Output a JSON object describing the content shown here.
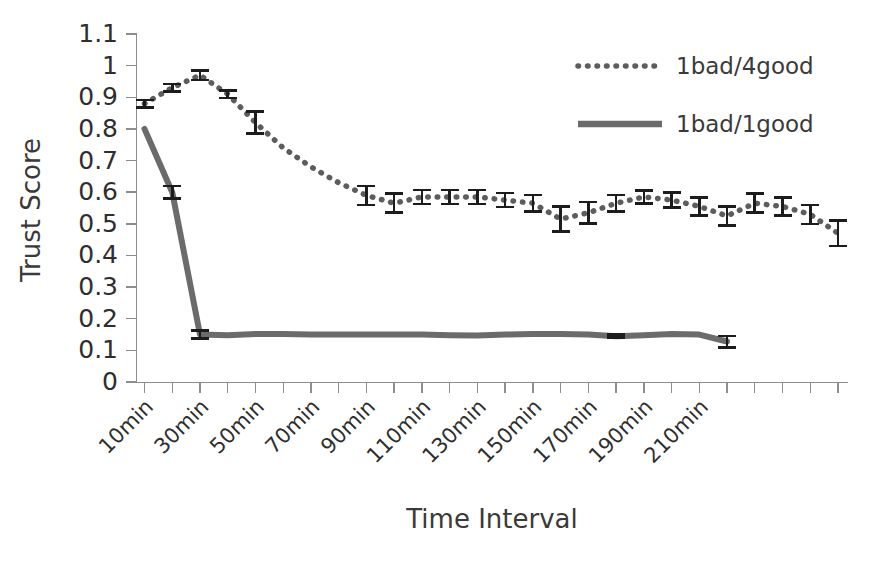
{
  "chart_data": {
    "type": "line",
    "title": "",
    "xlabel": "Time Interval",
    "ylabel": "Trust Score",
    "ylim": [
      0,
      1.1
    ],
    "ytick_labels": [
      "1.1",
      "1",
      "0.9",
      "0.8",
      "0.7",
      "0.6",
      "0.5",
      "0.4",
      "0.3",
      "0.2",
      "0.1",
      "0"
    ],
    "ytick_values": [
      1.1,
      1.0,
      0.9,
      0.8,
      0.7,
      0.6,
      0.5,
      0.4,
      0.3,
      0.2,
      0.1,
      0.0
    ],
    "xtick_labels": [
      "10min",
      "30min",
      "50min",
      "70min",
      "90min",
      "110min",
      "130min",
      "150min",
      "170min",
      "190min",
      "210min"
    ],
    "x": [
      10,
      20,
      30,
      40,
      50,
      60,
      70,
      80,
      90,
      100,
      110,
      120,
      130,
      140,
      150,
      160,
      170,
      180,
      190,
      200,
      210,
      220
    ],
    "grid": false,
    "legend_position": "top-right",
    "series": [
      {
        "name": "1bad/4good",
        "style": "dotted",
        "color": "#5d5d5d",
        "values": [
          0.88,
          0.93,
          0.97,
          0.91,
          0.82,
          0.74,
          0.68,
          0.63,
          0.59,
          0.57,
          0.58,
          0.585,
          0.585,
          0.58,
          0.57,
          0.555,
          0.51,
          0.535,
          0.565,
          0.585,
          0.575,
          0.555
        ],
        "values_tail": [
          0.56,
          0.525,
          0.565,
          0.555,
          0.53,
          0.47
        ],
        "error": [
          0.012,
          0.012,
          0.015,
          0.012,
          0.035,
          0.02,
          0.02,
          0.02,
          0.04,
          0.04,
          0.028,
          0.025,
          0.025,
          0.025,
          0.03,
          0.035,
          0.045,
          0.035,
          0.025,
          0.02,
          0.03,
          0.035
        ]
      },
      {
        "name": "1bad/1good",
        "style": "solid",
        "color": "#6b6b6b",
        "values": [
          0.8,
          0.6,
          0.15,
          0.148,
          0.152,
          0.152,
          0.15,
          0.15,
          0.15,
          0.15,
          0.15,
          0.148,
          0.147,
          0.15,
          0.152,
          0.152,
          0.15,
          0.145,
          0.148,
          0.152,
          0.15,
          0.128
        ],
        "error": [
          0.0,
          0.02,
          0.012,
          0.0,
          0.0,
          0.0,
          0.0,
          0.0,
          0.0,
          0.0,
          0.0,
          0.0,
          0.0,
          0.0,
          0.0,
          0.0,
          0.0,
          0.005,
          0.0,
          0.0,
          0.0,
          0.018
        ]
      }
    ],
    "series_full": {
      "dotted": [
        0.88,
        0.93,
        0.97,
        0.91,
        0.82,
        0.74,
        0.68,
        0.63,
        0.59,
        0.565,
        0.585,
        0.585,
        0.585,
        0.575,
        0.565,
        0.515,
        0.535,
        0.565,
        0.585,
        0.575,
        0.555,
        0.525,
        0.565,
        0.555,
        0.53,
        0.47
      ],
      "solid": [
        0.8,
        0.6,
        0.15,
        0.148,
        0.152,
        0.152,
        0.15,
        0.15,
        0.15,
        0.15,
        0.15,
        0.148,
        0.147,
        0.15,
        0.152,
        0.152,
        0.15,
        0.145,
        0.148,
        0.152,
        0.15,
        0.128
      ]
    }
  },
  "axes": {
    "y_title": "Trust Score",
    "x_title": "Time Interval"
  },
  "legend": {
    "entries": [
      {
        "label": "1bad/4good",
        "style": "dotted"
      },
      {
        "label": "1bad/1good",
        "style": "solid"
      }
    ]
  }
}
